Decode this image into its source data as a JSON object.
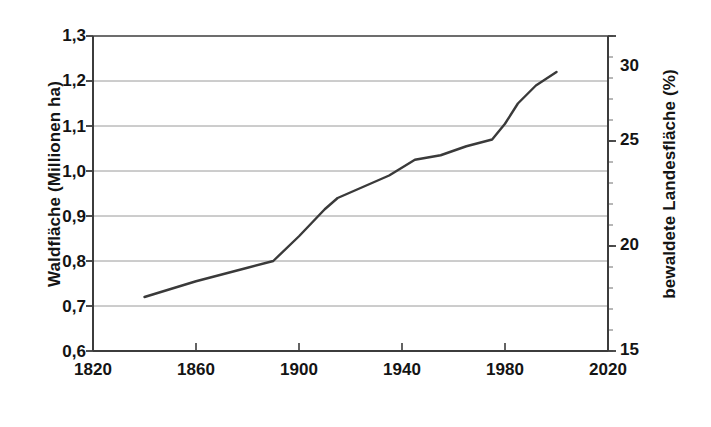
{
  "chart_data": {
    "type": "line",
    "title": "",
    "subtitle": "",
    "xlabel": "",
    "ylabel": "Waldfläche (Millionen ha)",
    "ylabel_right": "bewaldete Landesfläche (%)",
    "xlim": [
      1820,
      2020
    ],
    "ylim": [
      0.6,
      1.3
    ],
    "ylim_right": [
      15,
      30
    ],
    "xticks": [
      "1820",
      "1860",
      "1900",
      "1940",
      "1980",
      "2020"
    ],
    "xtick_values": [
      1820,
      1860,
      1900,
      1940,
      1980,
      2020
    ],
    "yticks": [
      "0,6",
      "0,7",
      "0,8",
      "0,9",
      "1,0",
      "1,1",
      "1,2",
      "1,3"
    ],
    "ytick_values": [
      0.6,
      0.7,
      0.8,
      0.9,
      1.0,
      1.1,
      1.2,
      1.3
    ],
    "yticks_right": [
      "15",
      "20",
      "25",
      "30"
    ],
    "ytick_right_values": [
      15,
      20,
      25,
      30
    ],
    "grid": true,
    "grid_axis": "y",
    "legend": false,
    "line_color": "#3a3a3a",
    "series": [
      {
        "name": "Waldfläche",
        "x": [
          1840,
          1860,
          1880,
          1890,
          1900,
          1905,
          1910,
          1915,
          1925,
          1935,
          1945,
          1950,
          1955,
          1965,
          1975,
          1980,
          1985,
          1992,
          2000
        ],
        "values": [
          0.72,
          0.755,
          0.785,
          0.8,
          0.855,
          0.885,
          0.915,
          0.94,
          0.965,
          0.99,
          1.025,
          1.03,
          1.035,
          1.055,
          1.07,
          1.105,
          1.15,
          1.19,
          1.22
        ]
      }
    ]
  }
}
